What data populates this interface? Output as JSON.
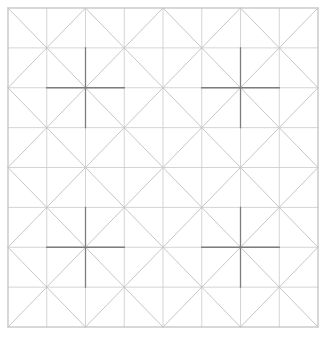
{
  "figure": {
    "width": 328,
    "height": 337,
    "background": "#ffffff"
  },
  "chart_data": {
    "type": "diagram",
    "title": "",
    "subtitle": "",
    "xlabel": "",
    "ylabel": "",
    "grid": true,
    "legend": null,
    "plot_area": {
      "x0": 8,
      "y0": 8,
      "x1": 318,
      "y1": 327,
      "width": 310,
      "height": 319
    },
    "grid_spec": {
      "columns": 8,
      "rows": 8,
      "cell_width": 38.75,
      "cell_height": 39.875,
      "x_ticks": [
        8,
        46.75,
        85.5,
        124.25,
        163,
        201.75,
        240.5,
        279.25,
        318
      ],
      "y_ticks": [
        8,
        47.875,
        87.75,
        127.625,
        167.5,
        207.375,
        247.25,
        287.125,
        327
      ]
    },
    "diagonal_rule": {
      "even_parity_direction": "backslash",
      "odd_parity_direction": "slash",
      "note": "cell (col,row) draws backslash when (col+row) is even, slash when odd"
    },
    "crosses": [
      {
        "name": "cross-top-left",
        "col": 2,
        "row": 2,
        "cx": 85.5,
        "cy": 87.75,
        "arm_cells": 1
      },
      {
        "name": "cross-top-right",
        "col": 6,
        "row": 2,
        "cx": 240.5,
        "cy": 87.75,
        "arm_cells": 1
      },
      {
        "name": "cross-bottom-left",
        "col": 2,
        "row": 6,
        "cx": 85.5,
        "cy": 247.25,
        "arm_cells": 1
      },
      {
        "name": "cross-bottom-right",
        "col": 6,
        "row": 6,
        "cx": 240.5,
        "cy": 247.25,
        "arm_cells": 1
      }
    ],
    "colors": {
      "background": "#ffffff",
      "grid_line": "#c9c9c9",
      "diagonal_line": "#b8b8b8",
      "cross_line": "#7d7d7d",
      "border_line": "#c4c4c4"
    },
    "stroke_widths": {
      "grid_line": 0.8,
      "diagonal_line": 0.8,
      "cross_line": 1.3,
      "border_line": 0.9
    }
  }
}
